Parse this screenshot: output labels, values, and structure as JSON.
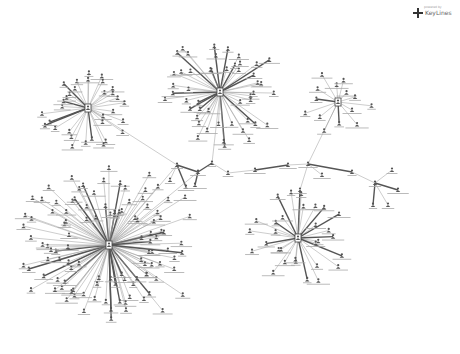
{
  "logo": {
    "name": "KeyLines",
    "subtitle": "powered by"
  },
  "graph": {
    "type": "network",
    "node_color": "#555555",
    "edge_color": "#9a9a9a",
    "heavy_edge_color": "#555555",
    "hubs": [
      {
        "id": "hub-large",
        "x": 109,
        "y": 245,
        "radius": 95,
        "leaves": 110
      },
      {
        "id": "hub-top",
        "x": 220,
        "y": 92,
        "radius": 62,
        "leaves": 48
      },
      {
        "id": "hub-left",
        "x": 88,
        "y": 108,
        "radius": 48,
        "leaves": 32
      },
      {
        "id": "hub-right",
        "x": 338,
        "y": 102,
        "radius": 38,
        "leaves": 14
      },
      {
        "id": "hub-lower-right",
        "x": 298,
        "y": 238,
        "radius": 52,
        "leaves": 30
      }
    ],
    "chain_nodes": [
      {
        "x": 177,
        "y": 165
      },
      {
        "x": 198,
        "y": 172
      },
      {
        "x": 212,
        "y": 163
      },
      {
        "x": 228,
        "y": 173
      },
      {
        "x": 255,
        "y": 170
      },
      {
        "x": 288,
        "y": 165
      },
      {
        "x": 308,
        "y": 164
      },
      {
        "x": 322,
        "y": 175
      },
      {
        "x": 352,
        "y": 172
      },
      {
        "x": 375,
        "y": 183
      },
      {
        "x": 392,
        "y": 170
      },
      {
        "x": 398,
        "y": 190
      },
      {
        "x": 388,
        "y": 205
      },
      {
        "x": 373,
        "y": 205
      },
      {
        "x": 300,
        "y": 190
      },
      {
        "x": 170,
        "y": 180
      },
      {
        "x": 186,
        "y": 187
      },
      {
        "x": 195,
        "y": 185
      }
    ],
    "chain_edges": [
      [
        88,
        108,
        177,
        165
      ],
      [
        220,
        92,
        212,
        163
      ],
      [
        177,
        165,
        198,
        172
      ],
      [
        198,
        172,
        212,
        163
      ],
      [
        212,
        163,
        228,
        173
      ],
      [
        228,
        173,
        255,
        170
      ],
      [
        255,
        170,
        288,
        165
      ],
      [
        288,
        165,
        308,
        164
      ],
      [
        308,
        164,
        338,
        102
      ],
      [
        308,
        164,
        322,
        175
      ],
      [
        308,
        164,
        352,
        172
      ],
      [
        352,
        172,
        375,
        183
      ],
      [
        375,
        183,
        392,
        170
      ],
      [
        375,
        183,
        398,
        190
      ],
      [
        375,
        183,
        388,
        205
      ],
      [
        375,
        183,
        373,
        205
      ],
      [
        308,
        164,
        300,
        190
      ],
      [
        300,
        190,
        298,
        238
      ],
      [
        177,
        165,
        109,
        245
      ],
      [
        177,
        165,
        170,
        180
      ],
      [
        177,
        165,
        186,
        187
      ],
      [
        198,
        172,
        195,
        185
      ],
      [
        109,
        245,
        198,
        172
      ]
    ]
  }
}
